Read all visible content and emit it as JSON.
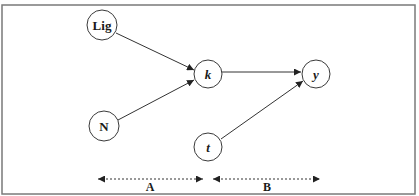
{
  "diagram": {
    "frame": {
      "x": 2,
      "y": 5,
      "width": 413,
      "height": 189,
      "color": "#7a7a7a"
    },
    "nodes": [
      {
        "id": "lig",
        "label": "Lig",
        "cx": 102,
        "cy": 25,
        "r": 15,
        "bold": true,
        "italic": false
      },
      {
        "id": "n",
        "label": "N",
        "cx": 104,
        "cy": 126,
        "r": 15,
        "bold": true,
        "italic": false
      },
      {
        "id": "k",
        "label": "k",
        "cx": 208,
        "cy": 74,
        "r": 14,
        "bold": true,
        "italic": true
      },
      {
        "id": "y",
        "label": "y",
        "cx": 316,
        "cy": 74,
        "r": 14,
        "bold": true,
        "italic": true
      },
      {
        "id": "t",
        "label": "t",
        "cx": 208,
        "cy": 147,
        "r": 14,
        "bold": true,
        "italic": true
      }
    ],
    "edges": [
      {
        "from": "lig",
        "to": "k",
        "x1": 116,
        "y1": 33,
        "x2": 194,
        "y2": 70
      },
      {
        "from": "n",
        "to": "k",
        "x1": 118,
        "y1": 120,
        "x2": 194,
        "y2": 80
      },
      {
        "from": "k",
        "to": "y",
        "x1": 222,
        "y1": 72,
        "x2": 301,
        "y2": 72
      },
      {
        "from": "t",
        "to": "y",
        "x1": 221,
        "y1": 139,
        "x2": 303,
        "y2": 81
      }
    ],
    "spans": [
      {
        "id": "A",
        "label": "A",
        "x1": 98,
        "x2": 203,
        "y": 179,
        "label_x": 150,
        "label_y": 191
      },
      {
        "id": "B",
        "label": "B",
        "x1": 213,
        "x2": 320,
        "y": 179,
        "label_x": 267,
        "label_y": 191
      }
    ],
    "colors": {
      "stroke": "#333333",
      "text": "#1a1a1a",
      "background": "#ffffff"
    }
  }
}
